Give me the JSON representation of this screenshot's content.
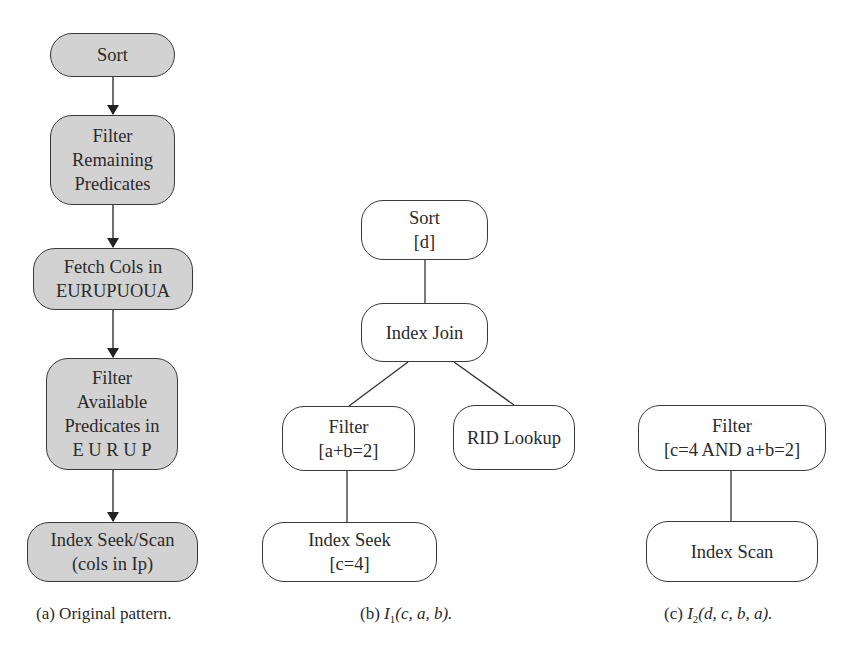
{
  "diagram_a": {
    "caption": "(a) Original pattern.",
    "nodes": [
      {
        "id": "sort",
        "lines": [
          "Sort"
        ]
      },
      {
        "id": "filter-remaining",
        "lines": [
          "Filter",
          "Remaining",
          "Predicates"
        ]
      },
      {
        "id": "fetch-cols",
        "lines": [
          "Fetch Cols in",
          "EURUPUOUA"
        ]
      },
      {
        "id": "filter-available",
        "lines": [
          "Filter",
          "Available",
          "Predicates in",
          "E U R U P"
        ]
      },
      {
        "id": "index-seek-scan",
        "lines": [
          "Index Seek/Scan",
          "(cols in Ip)"
        ]
      }
    ],
    "edges": [
      [
        "sort",
        "filter-remaining"
      ],
      [
        "filter-remaining",
        "fetch-cols"
      ],
      [
        "fetch-cols",
        "filter-available"
      ],
      [
        "filter-available",
        "index-seek-scan"
      ]
    ],
    "fill": "#d2d2d2"
  },
  "diagram_b": {
    "caption_prefix": "(b) ",
    "caption_index": "I",
    "caption_sub": "1",
    "caption_args": "(c, a, b).",
    "nodes": [
      {
        "id": "sort-d",
        "lines": [
          "Sort",
          "[d]"
        ]
      },
      {
        "id": "index-join",
        "lines": [
          "Index Join"
        ]
      },
      {
        "id": "filter-ab",
        "lines": [
          "Filter",
          "[a+b=2]"
        ]
      },
      {
        "id": "rid-lookup",
        "lines": [
          "RID Lookup"
        ]
      },
      {
        "id": "index-seek",
        "lines": [
          "Index Seek",
          "[c=4]"
        ]
      }
    ],
    "edges": [
      [
        "sort-d",
        "index-join"
      ],
      [
        "index-join",
        "filter-ab"
      ],
      [
        "index-join",
        "rid-lookup"
      ],
      [
        "filter-ab",
        "index-seek"
      ]
    ]
  },
  "diagram_c": {
    "caption_prefix": "(c) ",
    "caption_index": "I",
    "caption_sub": "2",
    "caption_args": "(d, c, b, a).",
    "nodes": [
      {
        "id": "filter-c-ab",
        "lines": [
          "Filter",
          "[c=4 AND a+b=2]"
        ]
      },
      {
        "id": "index-scan",
        "lines": [
          "Index Scan"
        ]
      }
    ],
    "edges": [
      [
        "filter-c-ab",
        "index-scan"
      ]
    ]
  }
}
